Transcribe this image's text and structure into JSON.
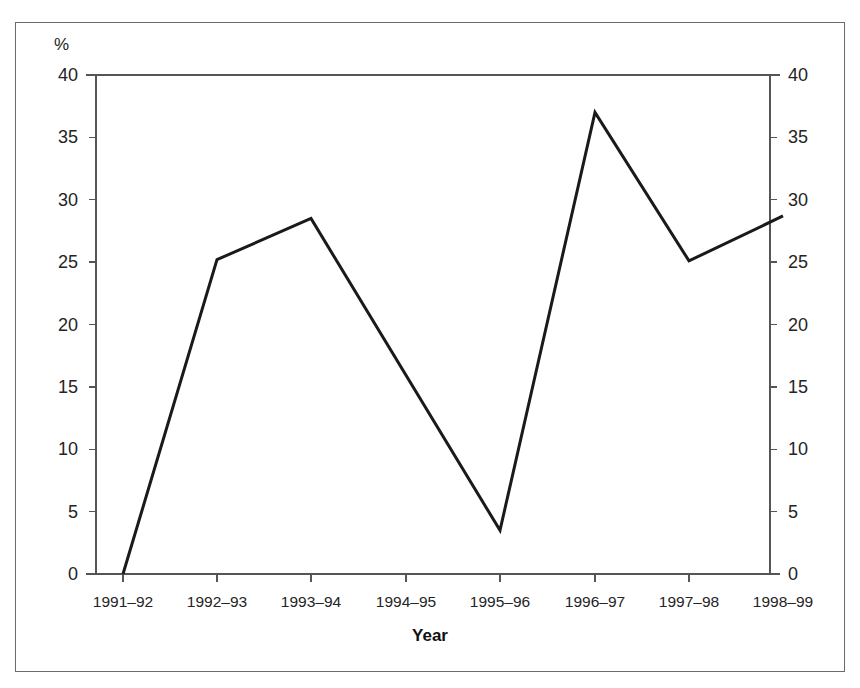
{
  "figure": {
    "unit_label": "%",
    "x_axis_title": "Year",
    "line_color": "#1a1a1a",
    "axis_color": "#555555",
    "frame_color": "#6b6b6b",
    "background": "#ffffff"
  },
  "chart_data": {
    "type": "line",
    "title": "",
    "subtitle": "",
    "xlabel": "Year",
    "ylabel": "%",
    "categories": [
      "1991–92",
      "1992–93",
      "1993–94",
      "1994–95",
      "1995–96",
      "1996–97",
      "1997–98",
      "1998–99"
    ],
    "values": [
      0,
      25.2,
      28.5,
      16.0,
      3.5,
      37.0,
      25.1,
      28.7
    ],
    "vertex_at_category": [
      true,
      true,
      true,
      false,
      true,
      true,
      true,
      true
    ],
    "ylim": [
      0,
      40
    ],
    "y_ticks": [
      0,
      5,
      10,
      15,
      20,
      25,
      30,
      35,
      40
    ],
    "y_tick_labels": [
      "0",
      "5",
      "10",
      "15",
      "20",
      "25",
      "30",
      "35",
      "40"
    ],
    "y_axis_duplicated_right": true,
    "y_ticks_right": [
      0,
      5,
      10,
      15,
      20,
      25,
      30,
      35,
      40
    ],
    "y_tick_labels_right": [
      "0",
      "5",
      "10",
      "15",
      "20",
      "25",
      "30",
      "35",
      "40"
    ],
    "x_tick_labels": [
      "1991–92",
      "1992–93",
      "1993–94",
      "1994–95",
      "1995–96",
      "1996–97",
      "1997–98",
      "1998–99"
    ],
    "grid": false,
    "legend": false,
    "legend_position": "none",
    "series": [
      {
        "name": "",
        "values": [
          0,
          25.2,
          28.5,
          16.0,
          3.5,
          37.0,
          25.1,
          28.7
        ]
      }
    ],
    "annotations": []
  },
  "geometry": {
    "plot_left": 96,
    "plot_right": 770,
    "plot_top": 75,
    "plot_bottom": 574,
    "x_positions": [
      123,
      217,
      311,
      406,
      500,
      595,
      689,
      783
    ],
    "note": "x_positions are pixel centers of the 8 category ticks"
  }
}
